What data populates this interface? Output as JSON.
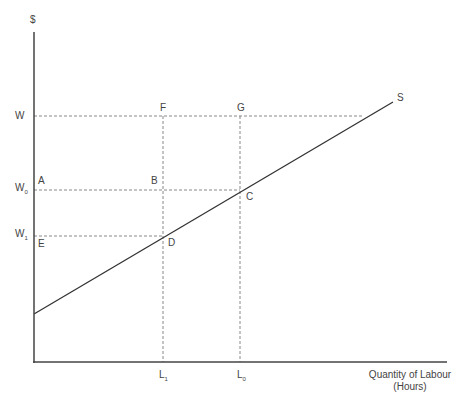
{
  "diagram": {
    "type": "labour-supply-curve",
    "y_axis_label": "$",
    "x_axis_label_line1": "Quantity of Labour",
    "x_axis_label_line2": "(Hours)",
    "curve_label": "S",
    "wage_levels": [
      {
        "id": "W",
        "label": "W",
        "sub": ""
      },
      {
        "id": "W0",
        "label": "W",
        "sub": "0"
      },
      {
        "id": "W1",
        "label": "W",
        "sub": "1"
      }
    ],
    "quantity_levels": [
      {
        "id": "L1",
        "label": "L",
        "sub": "1"
      },
      {
        "id": "L0",
        "label": "L",
        "sub": "0"
      }
    ],
    "points": {
      "A": "A",
      "B": "B",
      "C": "C",
      "D": "D",
      "E": "E",
      "F": "F",
      "G": "G"
    },
    "colors": {
      "axis": "#444444",
      "curve": "#333333",
      "guide": "#888888"
    }
  }
}
